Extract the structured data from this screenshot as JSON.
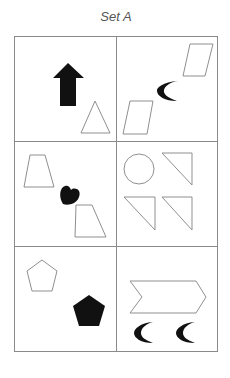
{
  "title": "Set A",
  "colors": {
    "grid_line": "#8a8a8a",
    "outline": "#8f8f8f",
    "fill": "#111111",
    "title": "#555555"
  },
  "grid": {
    "rows": 3,
    "cols": 2
  },
  "cells": [
    {
      "row": 1,
      "col": 1,
      "shapes": [
        "filled-up-arrow",
        "outline-triangle"
      ]
    },
    {
      "row": 1,
      "col": 2,
      "shapes": [
        "outline-parallelogram",
        "filled-crescent",
        "outline-parallelogram"
      ]
    },
    {
      "row": 2,
      "col": 1,
      "shapes": [
        "outline-trapezoid",
        "filled-heart",
        "outline-trapezoid"
      ]
    },
    {
      "row": 2,
      "col": 2,
      "shapes": [
        "outline-circle",
        "outline-right-triangle",
        "outline-right-triangle",
        "outline-right-triangle"
      ]
    },
    {
      "row": 3,
      "col": 1,
      "shapes": [
        "outline-pentagon",
        "filled-pentagon"
      ]
    },
    {
      "row": 3,
      "col": 2,
      "shapes": [
        "outline-chevron",
        "filled-crescent",
        "filled-crescent"
      ]
    }
  ]
}
